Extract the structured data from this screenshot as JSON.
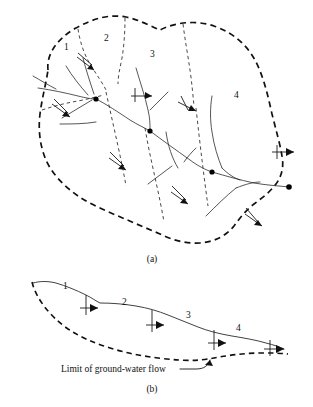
{
  "figure": {
    "panels": [
      {
        "id": "plan-view",
        "caption": "(a)",
        "caption_x": 152,
        "caption_y": 262,
        "basin_labels": [
          {
            "text": "1",
            "x": 64,
            "y": 50
          },
          {
            "text": "2",
            "x": 104,
            "y": 41
          },
          {
            "text": "3",
            "x": 150,
            "y": 57
          },
          {
            "text": "4",
            "x": 234,
            "y": 98
          }
        ]
      },
      {
        "id": "profile-view",
        "caption": "(b)",
        "caption_x": 152,
        "caption_y": 392,
        "segment_labels": [
          {
            "text": "1",
            "x": 63,
            "y": 289
          },
          {
            "text": "2",
            "x": 122,
            "y": 305
          },
          {
            "text": "3",
            "x": 186,
            "y": 318
          },
          {
            "text": "4",
            "x": 236,
            "y": 331
          }
        ],
        "annotation": {
          "text": "Limit of ground-water flow",
          "x": 61,
          "y": 372
        }
      }
    ],
    "legend_colors": {
      "divide_line": "#111111",
      "stream_line": "#2b2b2b",
      "background": "#ffffff"
    }
  }
}
